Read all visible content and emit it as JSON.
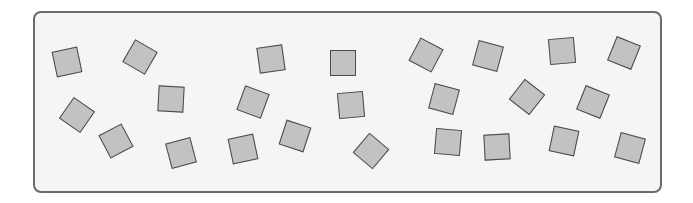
{
  "diagram": {
    "frame": {
      "border_color": "#6b6b6b",
      "fill": "#f5f5f5"
    },
    "square_style": {
      "fill": "#c2c2c2",
      "stroke": "#4a4a4a",
      "size": 26
    },
    "square_count": 24,
    "squares": [
      {
        "x": 67,
        "y": 62,
        "rot": -12
      },
      {
        "x": 140,
        "y": 57,
        "rot": 30
      },
      {
        "x": 271,
        "y": 59,
        "rot": -8
      },
      {
        "x": 343,
        "y": 63,
        "rot": 0
      },
      {
        "x": 426,
        "y": 55,
        "rot": 28
      },
      {
        "x": 488,
        "y": 56,
        "rot": 15
      },
      {
        "x": 562,
        "y": 51,
        "rot": -5
      },
      {
        "x": 624,
        "y": 53,
        "rot": 22
      },
      {
        "x": 77,
        "y": 115,
        "rot": 35
      },
      {
        "x": 171,
        "y": 99,
        "rot": 3
      },
      {
        "x": 253,
        "y": 102,
        "rot": 20
      },
      {
        "x": 351,
        "y": 105,
        "rot": -5
      },
      {
        "x": 444,
        "y": 99,
        "rot": 15
      },
      {
        "x": 527,
        "y": 97,
        "rot": 38
      },
      {
        "x": 593,
        "y": 102,
        "rot": 22
      },
      {
        "x": 116,
        "y": 141,
        "rot": -28
      },
      {
        "x": 181,
        "y": 153,
        "rot": -15
      },
      {
        "x": 243,
        "y": 149,
        "rot": -12
      },
      {
        "x": 295,
        "y": 136,
        "rot": 18
      },
      {
        "x": 371,
        "y": 151,
        "rot": 40
      },
      {
        "x": 448,
        "y": 142,
        "rot": 5
      },
      {
        "x": 497,
        "y": 147,
        "rot": -3
      },
      {
        "x": 564,
        "y": 141,
        "rot": 12
      },
      {
        "x": 630,
        "y": 148,
        "rot": 15
      }
    ]
  }
}
